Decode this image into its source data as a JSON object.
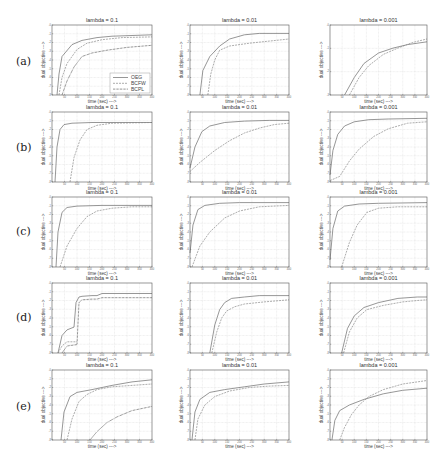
{
  "figure": {
    "row_labels": [
      "(a)",
      "(b)",
      "(c)",
      "(d)",
      "(e)"
    ],
    "column_titles": [
      "lambda = 0.1",
      "lambda = 0.01",
      "lambda = 0.001"
    ],
    "xlabel": "time (sec) --->",
    "ylabel": "dual objective --->",
    "legend": [
      "OEG",
      "BCFW",
      "BCPL"
    ]
  },
  "colors": {
    "frame": "#555555",
    "grid": "#d4d4d4",
    "series": [
      "#6a6a6a",
      "#8a8a8a",
      "#3c3c3c"
    ]
  },
  "chart_data": [
    {
      "panel": "a1",
      "row": "(a)",
      "type": "line",
      "title": "lambda = 0.1",
      "xlabel": "time (sec) --->",
      "ylabel": "dual objective --->",
      "grid": true,
      "legend": [
        "OEG",
        "BCFW",
        "BCPL"
      ],
      "legend_position": "lower right",
      "xlim": [
        0,
        1
      ],
      "ylim": [
        0,
        1
      ],
      "series": [
        {
          "name": "OEG",
          "x": [
            0.05,
            0.07,
            0.1,
            0.2,
            0.3,
            0.45,
            0.6,
            0.8,
            1.0
          ],
          "y": [
            0.0,
            0.3,
            0.55,
            0.72,
            0.78,
            0.82,
            0.84,
            0.85,
            0.86
          ]
        },
        {
          "name": "BCFW",
          "x": [
            0.07,
            0.1,
            0.15,
            0.25,
            0.35,
            0.5,
            0.7,
            1.0
          ],
          "y": [
            0.0,
            0.25,
            0.45,
            0.65,
            0.74,
            0.79,
            0.82,
            0.83
          ]
        },
        {
          "name": "BCPL",
          "x": [
            0.1,
            0.15,
            0.22,
            0.3,
            0.4,
            0.55,
            0.75,
            1.0
          ],
          "y": [
            0.0,
            0.2,
            0.4,
            0.55,
            0.6,
            0.64,
            0.68,
            0.71
          ]
        }
      ]
    },
    {
      "panel": "a2",
      "row": "(a)",
      "type": "line",
      "title": "lambda = 0.01",
      "xlabel": "time (sec) --->",
      "ylabel": "dual objective --->",
      "grid": true,
      "xlim": [
        0,
        1
      ],
      "ylim": [
        0,
        1
      ],
      "series": [
        {
          "name": "OEG",
          "x": [
            0.1,
            0.13,
            0.2,
            0.3,
            0.4,
            0.55,
            0.7,
            1.0
          ],
          "y": [
            0.0,
            0.35,
            0.55,
            0.7,
            0.8,
            0.86,
            0.88,
            0.88
          ]
        },
        {
          "name": "BCFW",
          "x": [
            0.18,
            0.21,
            0.25,
            0.3,
            0.4,
            0.6,
            0.8,
            1.0
          ],
          "y": [
            0.0,
            0.3,
            0.5,
            0.64,
            0.7,
            0.74,
            0.77,
            0.8
          ]
        }
      ]
    },
    {
      "panel": "a3",
      "row": "(a)",
      "type": "line",
      "title": "lambda = 0.001",
      "xlabel": "time (sec) --->",
      "ylabel": "dual objective --->",
      "grid": true,
      "xlim": [
        0,
        1
      ],
      "ylim": [
        0,
        1
      ],
      "series": [
        {
          "name": "OEG",
          "x": [
            0.15,
            0.25,
            0.35,
            0.5,
            0.65,
            0.8,
            1.0
          ],
          "y": [
            0.0,
            0.25,
            0.45,
            0.6,
            0.67,
            0.72,
            0.76
          ]
        },
        {
          "name": "BCFW",
          "x": [
            0.2,
            0.3,
            0.4,
            0.55,
            0.7,
            0.85,
            1.0
          ],
          "y": [
            0.0,
            0.25,
            0.42,
            0.58,
            0.67,
            0.75,
            0.8
          ]
        }
      ]
    },
    {
      "panel": "b1",
      "row": "(b)",
      "type": "line",
      "title": "lambda = 0.1",
      "xlabel": "time (sec) --->",
      "ylabel": "dual objective --->",
      "grid": true,
      "xlim": [
        0,
        1
      ],
      "ylim": [
        0,
        1
      ],
      "series": [
        {
          "name": "OEG",
          "x": [
            0.03,
            0.05,
            0.08,
            0.12,
            0.2,
            0.4,
            1.0
          ],
          "y": [
            0.0,
            0.5,
            0.75,
            0.82,
            0.84,
            0.85,
            0.85
          ]
        },
        {
          "name": "BCFW",
          "x": [
            0.18,
            0.22,
            0.28,
            0.35,
            0.45,
            0.6,
            1.0
          ],
          "y": [
            0.0,
            0.35,
            0.6,
            0.75,
            0.81,
            0.84,
            0.85
          ]
        }
      ]
    },
    {
      "panel": "b2",
      "row": "(b)",
      "type": "line",
      "title": "lambda = 0.01",
      "xlabel": "time (sec) --->",
      "ylabel": "dual objective --->",
      "grid": true,
      "xlim": [
        0,
        1
      ],
      "ylim": [
        0,
        1
      ],
      "series": [
        {
          "name": "OEG",
          "x": [
            0.0,
            0.05,
            0.12,
            0.2,
            0.35,
            0.55,
            0.8,
            1.0
          ],
          "y": [
            0.2,
            0.5,
            0.72,
            0.8,
            0.85,
            0.87,
            0.88,
            0.88
          ]
        },
        {
          "name": "BCFW",
          "x": [
            0.0,
            0.1,
            0.25,
            0.4,
            0.55,
            0.7,
            0.85,
            1.0
          ],
          "y": [
            0.15,
            0.28,
            0.45,
            0.59,
            0.7,
            0.77,
            0.82,
            0.84
          ]
        }
      ]
    },
    {
      "panel": "b3",
      "row": "(b)",
      "type": "line",
      "title": "lambda = 0.001",
      "xlabel": "time (sec) --->",
      "ylabel": "dual objective --->",
      "grid": true,
      "xlim": [
        0,
        1
      ],
      "ylim": [
        0,
        1
      ],
      "series": [
        {
          "name": "OEG",
          "x": [
            0.0,
            0.03,
            0.08,
            0.15,
            0.25,
            0.4,
            0.6,
            1.0
          ],
          "y": [
            0.1,
            0.45,
            0.68,
            0.8,
            0.86,
            0.89,
            0.9,
            0.91
          ]
        },
        {
          "name": "BCFW",
          "x": [
            0.0,
            0.1,
            0.2,
            0.3,
            0.45,
            0.6,
            0.8,
            1.0
          ],
          "y": [
            0.02,
            0.08,
            0.3,
            0.47,
            0.65,
            0.76,
            0.84,
            0.86
          ]
        }
      ]
    },
    {
      "panel": "c1",
      "row": "(c)",
      "type": "line",
      "title": "lambda = 0.1",
      "xlabel": "time (sec) --->",
      "ylabel": "dual objective --->",
      "grid": true,
      "xlim": [
        0,
        1
      ],
      "ylim": [
        0,
        1
      ],
      "series": [
        {
          "name": "OEG",
          "x": [
            0.04,
            0.06,
            0.1,
            0.15,
            0.25,
            0.5,
            1.0
          ],
          "y": [
            0.0,
            0.5,
            0.78,
            0.85,
            0.87,
            0.88,
            0.88
          ]
        },
        {
          "name": "BCFW",
          "x": [
            0.08,
            0.15,
            0.25,
            0.35,
            0.45,
            0.6,
            0.8,
            1.0
          ],
          "y": [
            0.0,
            0.3,
            0.55,
            0.72,
            0.8,
            0.84,
            0.86,
            0.86
          ]
        }
      ]
    },
    {
      "panel": "c2",
      "row": "(c)",
      "type": "line",
      "title": "lambda = 0.01",
      "xlabel": "time (sec) --->",
      "ylabel": "dual objective --->",
      "grid": true,
      "xlim": [
        0,
        1
      ],
      "ylim": [
        0,
        1
      ],
      "series": [
        {
          "name": "OEG",
          "x": [
            0.0,
            0.03,
            0.08,
            0.15,
            0.3,
            0.5,
            1.0
          ],
          "y": [
            0.2,
            0.6,
            0.82,
            0.88,
            0.91,
            0.92,
            0.92
          ]
        },
        {
          "name": "BCFW",
          "x": [
            0.02,
            0.1,
            0.2,
            0.35,
            0.5,
            0.7,
            1.0
          ],
          "y": [
            0.0,
            0.3,
            0.5,
            0.7,
            0.8,
            0.86,
            0.88
          ]
        }
      ]
    },
    {
      "panel": "c3",
      "row": "(c)",
      "type": "line",
      "title": "lambda = 0.001",
      "xlabel": "time (sec) --->",
      "ylabel": "dual objective --->",
      "grid": true,
      "xlim": [
        0,
        1
      ],
      "ylim": [
        0,
        1
      ],
      "series": [
        {
          "name": "OEG",
          "x": [
            0.0,
            0.03,
            0.08,
            0.15,
            0.3,
            0.5,
            1.0
          ],
          "y": [
            0.1,
            0.55,
            0.8,
            0.87,
            0.9,
            0.91,
            0.92
          ]
        },
        {
          "name": "BCFW",
          "x": [
            0.12,
            0.2,
            0.28,
            0.38,
            0.5,
            0.7,
            1.0
          ],
          "y": [
            0.0,
            0.35,
            0.6,
            0.78,
            0.84,
            0.86,
            0.86
          ]
        }
      ]
    },
    {
      "panel": "d1",
      "row": "(d)",
      "type": "line",
      "title": "lambda = 0.1",
      "xlabel": "time (sec) --->",
      "ylabel": "dual objective --->",
      "grid": true,
      "xlim": [
        0,
        1
      ],
      "ylim": [
        0,
        1
      ],
      "series": [
        {
          "name": "OEG",
          "x": [
            0.06,
            0.1,
            0.15,
            0.22,
            0.24,
            0.27,
            0.3,
            0.4,
            0.45,
            0.5,
            0.55,
            1.0
          ],
          "y": [
            0.0,
            0.25,
            0.33,
            0.37,
            0.72,
            0.8,
            0.81,
            0.82,
            0.82,
            0.85,
            0.85,
            0.85
          ]
        },
        {
          "name": "BCFW",
          "x": [
            0.06,
            0.1,
            0.15,
            0.25
          ],
          "y": [
            0.0,
            0.1,
            0.16,
            0.16
          ]
        },
        {
          "name": "BCPL",
          "x": [
            0.1,
            0.15,
            0.25,
            0.27,
            0.3,
            0.4,
            0.45,
            0.5,
            1.0
          ],
          "y": [
            0.0,
            0.1,
            0.12,
            0.72,
            0.76,
            0.77,
            0.77,
            0.79,
            0.79
          ]
        }
      ]
    },
    {
      "panel": "d2",
      "row": "(d)",
      "type": "line",
      "title": "lambda = 0.01",
      "xlabel": "time (sec) --->",
      "ylabel": "dual objective --->",
      "grid": true,
      "xlim": [
        0,
        1
      ],
      "ylim": [
        0,
        1
      ],
      "series": [
        {
          "name": "OEG",
          "x": [
            0.2,
            0.25,
            0.3,
            0.35,
            0.42,
            0.55,
            0.7,
            1.0
          ],
          "y": [
            0.0,
            0.4,
            0.62,
            0.72,
            0.78,
            0.8,
            0.82,
            0.82
          ]
        },
        {
          "name": "BCFW",
          "x": [
            0.22,
            0.27,
            0.32,
            0.37,
            0.45,
            0.55,
            0.75,
            1.0
          ],
          "y": [
            0.0,
            0.3,
            0.5,
            0.6,
            0.66,
            0.7,
            0.73,
            0.76
          ]
        }
      ]
    },
    {
      "panel": "d3",
      "row": "(d)",
      "type": "line",
      "title": "lambda = 0.001",
      "xlabel": "time (sec) --->",
      "ylabel": "dual objective --->",
      "grid": true,
      "xlim": [
        0,
        1
      ],
      "ylim": [
        0,
        1
      ],
      "series": [
        {
          "name": "OEG",
          "x": [
            0.12,
            0.18,
            0.25,
            0.35,
            0.5,
            0.7,
            0.9,
            1.0
          ],
          "y": [
            0.0,
            0.35,
            0.53,
            0.65,
            0.72,
            0.78,
            0.8,
            0.8
          ]
        },
        {
          "name": "BCFW",
          "x": [
            0.14,
            0.2,
            0.28,
            0.38,
            0.55,
            0.75,
            0.9,
            1.0
          ],
          "y": [
            0.0,
            0.3,
            0.5,
            0.62,
            0.68,
            0.73,
            0.75,
            0.76
          ]
        }
      ]
    },
    {
      "panel": "e1",
      "row": "(e)",
      "type": "line",
      "title": "lambda = 0.1",
      "xlabel": "time (sec) --->",
      "ylabel": "dual objective --->",
      "grid": true,
      "xlim": [
        0,
        1
      ],
      "ylim": [
        0,
        1
      ],
      "series": [
        {
          "name": "OEG",
          "x": [
            0.09,
            0.12,
            0.18,
            0.25,
            0.4,
            0.6,
            0.8,
            1.0
          ],
          "y": [
            0.0,
            0.4,
            0.62,
            0.68,
            0.72,
            0.78,
            0.83,
            0.86
          ]
        },
        {
          "name": "BCFW",
          "x": [
            0.15,
            0.2,
            0.27,
            0.35,
            0.45,
            0.6,
            0.8,
            1.0
          ],
          "y": [
            0.0,
            0.3,
            0.55,
            0.65,
            0.72,
            0.76,
            0.78,
            0.8
          ]
        },
        {
          "name": "BCPL",
          "x": [
            0.38,
            0.45,
            0.55,
            0.65,
            0.8,
            1.0
          ],
          "y": [
            0.0,
            0.12,
            0.25,
            0.33,
            0.42,
            0.48
          ]
        }
      ]
    },
    {
      "panel": "e2",
      "row": "(e)",
      "type": "line",
      "title": "lambda = 0.01",
      "xlabel": "time (sec) --->",
      "ylabel": "dual objective --->",
      "grid": true,
      "xlim": [
        0,
        1
      ],
      "ylim": [
        0,
        1
      ],
      "series": [
        {
          "name": "OEG",
          "x": [
            0.02,
            0.05,
            0.1,
            0.2,
            0.35,
            0.55,
            0.75,
            1.0
          ],
          "y": [
            0.0,
            0.4,
            0.58,
            0.68,
            0.72,
            0.76,
            0.8,
            0.83
          ]
        },
        {
          "name": "BCFW",
          "x": [
            0.05,
            0.08,
            0.15,
            0.25,
            0.4,
            0.6,
            0.8,
            1.0
          ],
          "y": [
            0.0,
            0.3,
            0.5,
            0.62,
            0.7,
            0.75,
            0.77,
            0.78
          ]
        }
      ]
    },
    {
      "panel": "e3",
      "row": "(e)",
      "type": "line",
      "title": "lambda = 0.001",
      "xlabel": "time (sec) --->",
      "ylabel": "dual objective --->",
      "grid": true,
      "xlim": [
        0,
        1
      ],
      "ylim": [
        0,
        1
      ],
      "series": [
        {
          "name": "OEG",
          "x": [
            0.02,
            0.05,
            0.1,
            0.2,
            0.35,
            0.55,
            0.75,
            1.0
          ],
          "y": [
            0.0,
            0.28,
            0.42,
            0.5,
            0.58,
            0.66,
            0.71,
            0.74
          ]
        },
        {
          "name": "BCFW",
          "x": [
            0.1,
            0.15,
            0.22,
            0.3,
            0.4,
            0.55,
            0.75,
            1.0
          ],
          "y": [
            0.0,
            0.18,
            0.36,
            0.5,
            0.62,
            0.72,
            0.8,
            0.85
          ]
        }
      ]
    }
  ]
}
